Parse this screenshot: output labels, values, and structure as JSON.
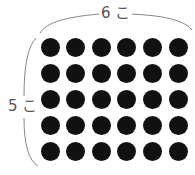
{
  "diagram": {
    "top_label": "6 こ",
    "left_label": "5 こ",
    "rows": 5,
    "columns": 6,
    "dot_color": "#111111",
    "bracket_color": "#888888"
  }
}
